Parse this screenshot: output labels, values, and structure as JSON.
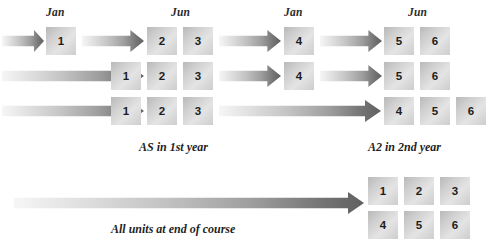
{
  "diagram": {
    "title_visible": false,
    "colors": {
      "box_light": "#e4e4e4",
      "box_mid": "#cfcfcf",
      "box_dark": "#b9b9b9",
      "arrow_tip": "#606060",
      "arrow_tail": "#f6f6f6",
      "text": "#1d1d1d"
    },
    "month_labels": [
      {
        "text": "Jan",
        "x": 46,
        "y": 6
      },
      {
        "text": "Jun",
        "x": 171,
        "y": 6
      },
      {
        "text": "Jun",
        "x": 147,
        "y": 6
      },
      {
        "text": "Jan",
        "x": 284,
        "y": 6
      },
      {
        "text": "Jun",
        "x": 408,
        "y": 6
      }
    ],
    "rows": [
      {
        "name": "row-1",
        "y": 27,
        "arrows": [
          {
            "x": 2,
            "w": 42
          },
          {
            "x": 82,
            "w": 62
          },
          {
            "x": 219,
            "w": 62
          },
          {
            "x": 320,
            "w": 62
          }
        ],
        "boxes": [
          {
            "label": "1",
            "x": 46
          },
          {
            "label": "2",
            "x": 147
          },
          {
            "label": "3",
            "x": 183
          },
          {
            "label": "4",
            "x": 284
          },
          {
            "label": "5",
            "x": 384
          },
          {
            "label": "6",
            "x": 420
          }
        ]
      },
      {
        "name": "row-2",
        "y": 62,
        "arrows": [
          {
            "x": 2,
            "w": 142
          },
          {
            "x": 219,
            "w": 62
          },
          {
            "x": 320,
            "w": 62
          }
        ],
        "boxes": [
          {
            "label": "1",
            "x": 111
          },
          {
            "label": "2",
            "x": 147
          },
          {
            "label": "3",
            "x": 183
          },
          {
            "label": "4",
            "x": 284
          },
          {
            "label": "5",
            "x": 384
          },
          {
            "label": "6",
            "x": 420
          }
        ]
      },
      {
        "name": "row-3",
        "y": 97,
        "arrows": [
          {
            "x": 2,
            "w": 142
          },
          {
            "x": 219,
            "w": 162
          }
        ],
        "boxes": [
          {
            "label": "1",
            "x": 111
          },
          {
            "label": "2",
            "x": 147
          },
          {
            "label": "3",
            "x": 183
          },
          {
            "label": "4",
            "x": 384
          },
          {
            "label": "5",
            "x": 420
          },
          {
            "label": "6",
            "x": 456
          }
        ]
      }
    ],
    "captions": [
      {
        "text": "AS in 1st year",
        "x": 139,
        "y": 140
      },
      {
        "text": "A2 in 2nd year",
        "x": 368,
        "y": 140
      },
      {
        "text": "All units at end of course",
        "x": 111,
        "y": 222
      }
    ],
    "summary": {
      "name": "summary-row",
      "arrow": {
        "x": 14,
        "y": 192,
        "w": 350
      },
      "grid": {
        "rows": [
          {
            "y": 177,
            "boxes": [
              {
                "label": "1",
                "x": 368
              },
              {
                "label": "2",
                "x": 404
              },
              {
                "label": "3",
                "x": 440
              }
            ]
          },
          {
            "y": 211,
            "boxes": [
              {
                "label": "4",
                "x": 368
              },
              {
                "label": "5",
                "x": 404
              },
              {
                "label": "6",
                "x": 440
              }
            ]
          }
        ]
      }
    }
  }
}
